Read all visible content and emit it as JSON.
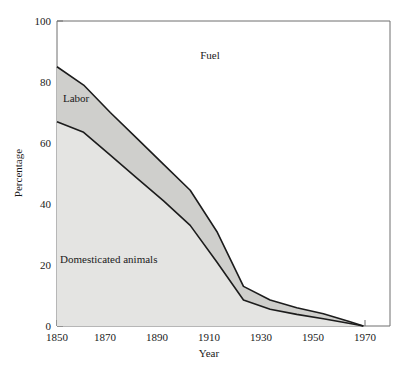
{
  "chart_data": {
    "type": "area",
    "title": "",
    "subtitle": "",
    "xlabel": "Year",
    "ylabel": "Percentage",
    "xlim": [
      1850,
      1975
    ],
    "ylim": [
      0,
      100
    ],
    "xticks": [
      1850,
      1870,
      1890,
      1910,
      1930,
      1950,
      1970
    ],
    "xtick_labels": [
      "1850",
      "1870",
      "1890",
      "1910",
      "1930",
      "1950",
      "1970"
    ],
    "yticks": [
      0,
      20,
      40,
      60,
      80,
      100
    ],
    "ytick_labels": [
      "0",
      "20",
      "40",
      "60",
      "80",
      "100"
    ],
    "grid": false,
    "legend_position": "in-plot-annotations",
    "stacked": true,
    "x": [
      1850,
      1860,
      1870,
      1880,
      1890,
      1900,
      1910,
      1920,
      1930,
      1940,
      1950,
      1960,
      1965
    ],
    "series": [
      {
        "name": "Domesticated animals",
        "label": "Domesticated animals",
        "fill_color": "#e4e4e2",
        "line_color": "#1c1c1c",
        "values": [
          67,
          63.5,
          56,
          48.5,
          41,
          33,
          21,
          8.5,
          5.5,
          3.8,
          2.4,
          0.8,
          0
        ]
      },
      {
        "name": "Labor",
        "label": "Labor",
        "fill_color": "#cfcfcc",
        "line_color": "#1c1c1c",
        "values": [
          18,
          15.5,
          14,
          13,
          12,
          11.5,
          10,
          4.5,
          3.0,
          2.2,
          1.6,
          0.6,
          0
        ]
      },
      {
        "name": "Fuel",
        "label": "Fuel",
        "fill_color": "#ffffff",
        "line_color": "#1c1c1c",
        "values": [
          15,
          21,
          30,
          38.5,
          47,
          55.5,
          69,
          87,
          91.5,
          94,
          96,
          98.6,
          100
        ]
      }
    ],
    "cumulative_upper": {
      "domesticated_animals": [
        67,
        63.5,
        56,
        48.5,
        41,
        33,
        21,
        8.5,
        5.5,
        3.8,
        2.4,
        0.8,
        0
      ],
      "labor": [
        85,
        79,
        70,
        61.5,
        53,
        44.5,
        31,
        13,
        8.5,
        6,
        4,
        1.4,
        0
      ]
    },
    "annotations": [
      {
        "text": "Fuel",
        "x": 1905,
        "y": 88
      },
      {
        "text": "Labor",
        "x": 1857,
        "y": 73
      },
      {
        "text": "Domesticated animals",
        "x": 1862,
        "y": 23
      }
    ]
  },
  "colors": {
    "axis": "#6e6e6e",
    "outline": "#1c1c1c",
    "band_lower_fill": "#e4e4e2",
    "band_upper_fill": "#cfcfcc",
    "background": "#ffffff",
    "text": "#1a1a1a"
  }
}
